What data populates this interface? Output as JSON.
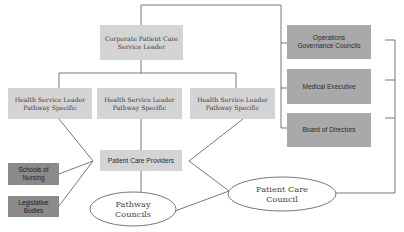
{
  "diagram": {
    "corporate_leader": {
      "line1": "Corporate Patient Care",
      "line2": "Service Leader"
    },
    "health_service_leaders": [
      {
        "line1": "Health Service Leader",
        "line2": "Pathway Specific"
      },
      {
        "line1": "Health Service Leader",
        "line2": "Pathway Specific"
      },
      {
        "line1": "Health Service Leader",
        "line2": "Pathway Specific"
      }
    ],
    "patient_care_providers": "Patient Care Providers",
    "schools_of_nursing": {
      "line1": "Schools of",
      "line2": "Nursing"
    },
    "legislative_bodies": {
      "line1": "Legislative",
      "line2": "Bodies"
    },
    "pathway_councils": {
      "line1": "Pathway",
      "line2": "Councils"
    },
    "patient_care_council": {
      "line1": "Patient Care",
      "line2": "Council"
    },
    "governance": [
      {
        "line1": "Operations",
        "line2": "Governance Councils"
      },
      {
        "line1": "Medical Executive",
        "line2": ""
      },
      {
        "line1": "Board of Directors",
        "line2": ""
      }
    ],
    "colors": {
      "light_box": "#d4d4d4",
      "governance_box": "#a9a9a9",
      "external_box": "#8a8a8a",
      "line": "#555555"
    }
  }
}
